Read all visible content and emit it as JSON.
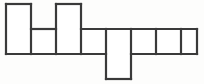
{
  "figure": {
    "kind": "grid-polyomino-outline",
    "canvas": {
      "width": 204,
      "height": 84
    },
    "background_color": "#fdfdfc",
    "stroke_color": "#3a3a3a",
    "fill_color": "#ffffff",
    "stroke_width": 2.2,
    "grid": {
      "origin_x": 6,
      "origin_y": 4,
      "cell_width": 25,
      "cell_height": 25,
      "columns": 8,
      "rows": 3,
      "column_x": [
        6,
        31,
        56,
        81,
        106,
        131,
        156,
        181,
        197
      ],
      "row_y": [
        4,
        29,
        54,
        79
      ]
    },
    "cells": [
      {
        "id": "cell-r0c0",
        "col": 0,
        "row": 0,
        "x": 6,
        "y": 4,
        "w": 25,
        "h": 25
      },
      {
        "id": "cell-r0c2",
        "col": 2,
        "row": 0,
        "x": 56,
        "y": 4,
        "w": 25,
        "h": 25
      },
      {
        "id": "cell-r1c0",
        "col": 0,
        "row": 1,
        "x": 6,
        "y": 29,
        "w": 25,
        "h": 25
      },
      {
        "id": "cell-r1c1",
        "col": 1,
        "row": 1,
        "x": 31,
        "y": 29,
        "w": 25,
        "h": 25
      },
      {
        "id": "cell-r1c2",
        "col": 2,
        "row": 1,
        "x": 56,
        "y": 29,
        "w": 25,
        "h": 25
      },
      {
        "id": "cell-r1c3",
        "col": 3,
        "row": 1,
        "x": 81,
        "y": 29,
        "w": 25,
        "h": 25
      },
      {
        "id": "cell-r1c4",
        "col": 4,
        "row": 1,
        "x": 106,
        "y": 29,
        "w": 25,
        "h": 25
      },
      {
        "id": "cell-r1c5",
        "col": 5,
        "row": 1,
        "x": 131,
        "y": 29,
        "w": 25,
        "h": 25
      },
      {
        "id": "cell-r1c6",
        "col": 6,
        "row": 1,
        "x": 156,
        "y": 29,
        "w": 25,
        "h": 25
      },
      {
        "id": "cell-r1c7",
        "col": 7,
        "row": 1,
        "x": 181,
        "y": 29,
        "w": 16,
        "h": 25
      },
      {
        "id": "cell-r2c4",
        "col": 4,
        "row": 2,
        "x": 106,
        "y": 54,
        "w": 25,
        "h": 25
      }
    ],
    "outline_path": "M6,4 L31,4 L31,29 L56,29 L56,4 L81,4 L81,29 L106,29 L106,54 L131,54 L131,29 L197,29 L197,54 L131,54 L131,79 L106,79 L106,54 L6,54 Z",
    "segments": [
      {
        "id": "seg-top-cell-a",
        "x1": 6,
        "y1": 4,
        "x2": 31,
        "y2": 4
      },
      {
        "id": "seg-left-cell-a",
        "x1": 6,
        "y1": 4,
        "x2": 6,
        "y2": 54
      },
      {
        "id": "seg-right-cell-a",
        "x1": 31,
        "y1": 4,
        "x2": 31,
        "y2": 54
      },
      {
        "id": "seg-top-mid-row-left",
        "x1": 31,
        "y1": 29,
        "x2": 56,
        "y2": 29
      },
      {
        "id": "seg-divider-b-c",
        "x1": 56,
        "y1": 4,
        "x2": 56,
        "y2": 54
      },
      {
        "id": "seg-top-cell-c",
        "x1": 56,
        "y1": 4,
        "x2": 81,
        "y2": 4
      },
      {
        "id": "seg-right-cell-c",
        "x1": 81,
        "y1": 4,
        "x2": 81,
        "y2": 54
      },
      {
        "id": "seg-top-mid-row-right",
        "x1": 81,
        "y1": 29,
        "x2": 197,
        "y2": 29
      },
      {
        "id": "seg-divider-d-e",
        "x1": 106,
        "y1": 29,
        "x2": 106,
        "y2": 79
      },
      {
        "id": "seg-divider-e-f",
        "x1": 131,
        "y1": 29,
        "x2": 131,
        "y2": 79
      },
      {
        "id": "seg-divider-f-g",
        "x1": 156,
        "y1": 29,
        "x2": 156,
        "y2": 54
      },
      {
        "id": "seg-divider-g-h",
        "x1": 181,
        "y1": 29,
        "x2": 181,
        "y2": 54
      },
      {
        "id": "seg-right-end",
        "x1": 197,
        "y1": 29,
        "x2": 197,
        "y2": 54
      },
      {
        "id": "seg-bottom-main-left",
        "x1": 6,
        "y1": 54,
        "x2": 106,
        "y2": 54
      },
      {
        "id": "seg-bottom-main-right",
        "x1": 131,
        "y1": 54,
        "x2": 197,
        "y2": 54
      },
      {
        "id": "seg-bottom-hanging",
        "x1": 106,
        "y1": 79,
        "x2": 131,
        "y2": 79
      }
    ]
  }
}
